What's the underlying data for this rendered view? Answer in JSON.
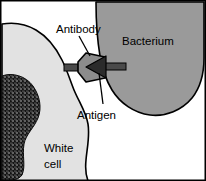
{
  "figure": {
    "frame_color": "#000000",
    "background": "#ffffff"
  },
  "labels": {
    "antibody": "Antibody",
    "bacterium": "Bacterium",
    "antigen": "Antigen",
    "white_cell_line1": "White",
    "white_cell_line2": "cell"
  },
  "structures": {
    "white_cell": {
      "name": "White cell",
      "fill": "#e2e2e2",
      "stroke": "#000000"
    },
    "white_cell_nucleus": {
      "name": "Nucleus",
      "fill": "#1a1a1a",
      "texture": "stippled"
    },
    "bacterium": {
      "name": "Bacterium",
      "fill": "#9a9a9a",
      "stroke": "#000000"
    },
    "antibody": {
      "name": "Antibody",
      "fill": "#8c8c8c",
      "stroke": "#000000"
    },
    "antigen": {
      "name": "Antigen",
      "fill": "#2b2b2b",
      "stroke": "#000000"
    },
    "connector_arms": {
      "name": "Binding arms",
      "fill": "#4a4a4a"
    }
  }
}
